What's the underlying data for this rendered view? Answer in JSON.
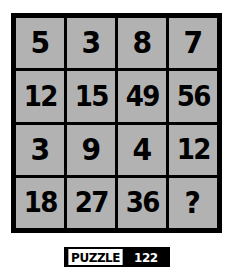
{
  "puzzle": {
    "rows": [
      [
        {
          "value": "5",
          "is_unknown": false
        },
        {
          "value": "3",
          "is_unknown": false
        },
        {
          "value": "8",
          "is_unknown": false
        },
        {
          "value": "7",
          "is_unknown": false
        }
      ],
      [
        {
          "value": "12",
          "is_unknown": false
        },
        {
          "value": "15",
          "is_unknown": false
        },
        {
          "value": "49",
          "is_unknown": false
        },
        {
          "value": "56",
          "is_unknown": false
        }
      ],
      [
        {
          "value": "3",
          "is_unknown": false
        },
        {
          "value": "9",
          "is_unknown": false
        },
        {
          "value": "4",
          "is_unknown": false
        },
        {
          "value": "12",
          "is_unknown": false
        }
      ],
      [
        {
          "value": "18",
          "is_unknown": false
        },
        {
          "value": "27",
          "is_unknown": false
        },
        {
          "value": "36",
          "is_unknown": false
        },
        {
          "value": "?",
          "is_unknown": true
        }
      ]
    ],
    "grid_columns": 4,
    "grid_rows": 4
  },
  "footer": {
    "label": "PUZZLE",
    "number": "122"
  },
  "colors": {
    "page_background": "#ffffff",
    "grid_line": "#000000",
    "cell_background": "#b2b2b2",
    "cell_text": "#000000",
    "badge_label_background": "#ffffff",
    "badge_label_text": "#000000",
    "badge_number_background": "#000000",
    "badge_number_text": "#ffffff"
  }
}
